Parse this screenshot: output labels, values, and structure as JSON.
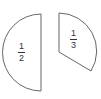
{
  "diagram": {
    "shapes": [
      {
        "name": "half-circle",
        "fraction": {
          "numerator": "1",
          "denominator": "2"
        }
      },
      {
        "name": "third-sector",
        "fraction": {
          "numerator": "1",
          "denominator": "3"
        }
      }
    ],
    "stroke_color": "#666666",
    "fill_color": "#ffffff"
  }
}
